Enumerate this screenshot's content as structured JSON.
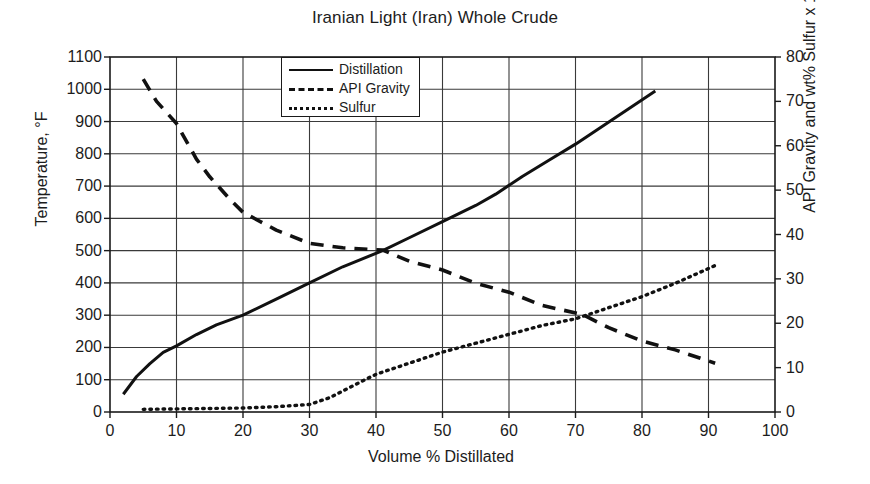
{
  "chart_data": {
    "type": "line",
    "title": "Iranian Light (Iran) Whole Crude",
    "xlabel": "Volume % Distillated",
    "ylabel": "Temperature, °F",
    "y2label": "API Gravity and wt% Sulfur x 10",
    "xlim": [
      0,
      100
    ],
    "ylim": [
      0,
      1100
    ],
    "y2lim": [
      0,
      80
    ],
    "xticks": [
      0,
      10,
      20,
      30,
      40,
      50,
      60,
      70,
      80,
      90,
      100
    ],
    "yticks": [
      0,
      100,
      200,
      300,
      400,
      500,
      600,
      700,
      800,
      900,
      1000,
      1100
    ],
    "y2ticks": [
      0,
      10,
      20,
      30,
      40,
      50,
      60,
      70,
      80
    ],
    "grid": true,
    "legend_position": "top-center",
    "series": [
      {
        "name": "Distillation",
        "axis": "left",
        "style": "solid",
        "color": "#111111",
        "points": [
          [
            2,
            55
          ],
          [
            4,
            110
          ],
          [
            6,
            150
          ],
          [
            8,
            185
          ],
          [
            10,
            205
          ],
          [
            13,
            240
          ],
          [
            16,
            270
          ],
          [
            20,
            300
          ],
          [
            25,
            350
          ],
          [
            30,
            400
          ],
          [
            35,
            450
          ],
          [
            41,
            500
          ],
          [
            45,
            540
          ],
          [
            50,
            590
          ],
          [
            55,
            640
          ],
          [
            58,
            675
          ],
          [
            62,
            730
          ],
          [
            66,
            780
          ],
          [
            70,
            830
          ],
          [
            74,
            885
          ],
          [
            78,
            940
          ],
          [
            82,
            995
          ]
        ]
      },
      {
        "name": "API Gravity",
        "axis": "right",
        "style": "dashed",
        "color": "#111111",
        "points": [
          [
            5,
            75
          ],
          [
            7,
            70
          ],
          [
            10,
            65
          ],
          [
            13,
            57
          ],
          [
            15,
            53
          ],
          [
            18,
            48
          ],
          [
            20,
            45
          ],
          [
            25,
            41
          ],
          [
            30,
            38
          ],
          [
            35,
            37
          ],
          [
            41,
            36.5
          ],
          [
            45,
            34
          ],
          [
            50,
            32
          ],
          [
            55,
            29
          ],
          [
            60,
            27
          ],
          [
            65,
            24
          ],
          [
            71,
            22
          ],
          [
            75,
            19
          ],
          [
            80,
            16
          ],
          [
            85,
            14
          ],
          [
            91,
            11
          ]
        ]
      },
      {
        "name": "Sulfur",
        "axis": "right",
        "style": "dotted",
        "color": "#111111",
        "points": [
          [
            5,
            0.6
          ],
          [
            10,
            0.7
          ],
          [
            15,
            0.8
          ],
          [
            20,
            0.9
          ],
          [
            25,
            1.2
          ],
          [
            30,
            1.7
          ],
          [
            33,
            3.2
          ],
          [
            36,
            5.5
          ],
          [
            40,
            8.5
          ],
          [
            45,
            11
          ],
          [
            50,
            13.5
          ],
          [
            55,
            15.5
          ],
          [
            60,
            17.5
          ],
          [
            65,
            19.5
          ],
          [
            70,
            21
          ],
          [
            75,
            23.5
          ],
          [
            80,
            26
          ],
          [
            85,
            29
          ],
          [
            91,
            33
          ]
        ]
      }
    ]
  },
  "legend": {
    "items": [
      {
        "label": "Distillation",
        "style": "solid"
      },
      {
        "label": "API Gravity",
        "style": "dashed"
      },
      {
        "label": "Sulfur",
        "style": "dotted"
      }
    ]
  }
}
